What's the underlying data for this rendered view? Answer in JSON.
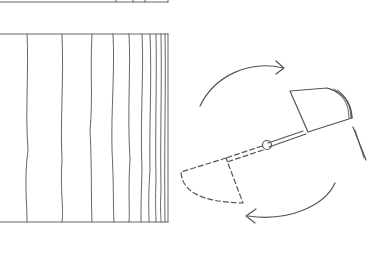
{
  "diagram": {
    "colors": {
      "line": "#555555",
      "background": "#ffffff"
    },
    "panel": {
      "top_strip_y": 2,
      "frame": {
        "x": 0,
        "y": 33,
        "right": 168,
        "bottom": 222
      },
      "vertical_line_x": [
        27,
        62,
        92,
        113,
        129,
        142,
        150,
        156,
        161,
        165
      ]
    },
    "rotor": {
      "pivot": {
        "x": 268,
        "y": 145
      },
      "solid_flap": "upper-right position",
      "dashed_flap": "lower-left position",
      "arrows": [
        "top arrow pointing right (clockwise)",
        "bottom arrow pointing left (clockwise)"
      ]
    }
  }
}
